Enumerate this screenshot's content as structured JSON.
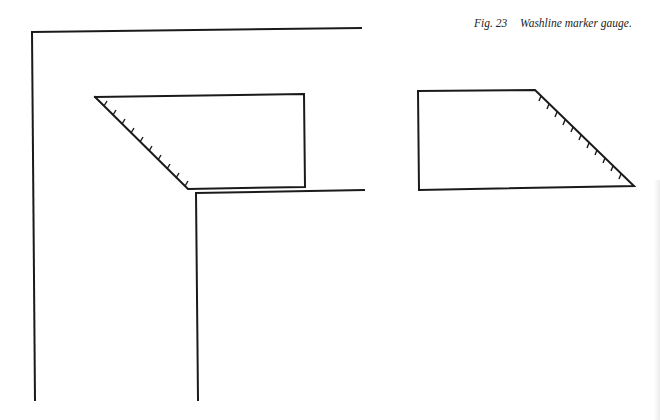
{
  "figure": {
    "label": "Fig. 23",
    "title": "Washline marker gauge."
  },
  "colors": {
    "ink": "#1a1a1a",
    "paper": "#ffffff"
  }
}
